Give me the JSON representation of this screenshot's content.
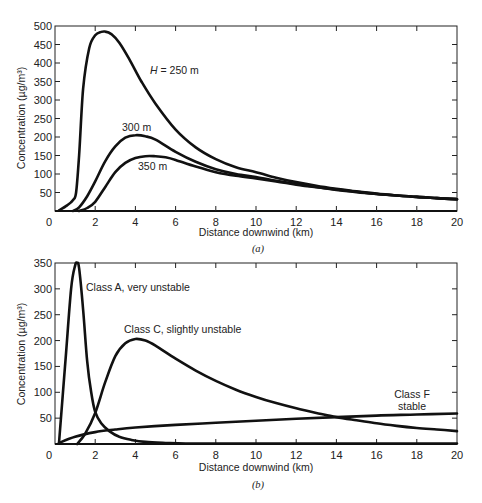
{
  "chart_data": [
    {
      "id": "a",
      "type": "line",
      "caption": "(a)",
      "title": "",
      "xlabel": "Distance downwind (km)",
      "ylabel": "Concentration (µg/m³)",
      "xlim": [
        0,
        20
      ],
      "ylim": [
        0,
        500
      ],
      "xticks": [
        0,
        2,
        4,
        6,
        8,
        10,
        12,
        14,
        16,
        18,
        20
      ],
      "yticks": [
        50,
        100,
        150,
        200,
        250,
        300,
        350,
        400,
        450,
        500
      ],
      "grid": false,
      "legend": "inline annotations",
      "series": [
        {
          "name": "H = 250 m",
          "label_pos": [
            7.4,
            380
          ],
          "x": [
            0.2,
            0.6,
            0.9,
            1.05,
            1.2,
            1.4,
            1.7,
            2.0,
            2.3,
            2.5,
            2.8,
            3.2,
            3.7,
            4.3,
            5.0,
            6.0,
            7.0,
            8.0,
            9.0,
            10.0,
            11.0,
            12.0,
            13.0,
            14.0,
            15.0,
            16.0,
            17.0,
            18.0,
            19.0,
            20.0
          ],
          "y": [
            2,
            15,
            30,
            50,
            150,
            330,
            440,
            475,
            484,
            485,
            478,
            455,
            410,
            350,
            290,
            220,
            172,
            140,
            118,
            105,
            90,
            78,
            68,
            60,
            53,
            47,
            42,
            38,
            35,
            32
          ]
        },
        {
          "name": "300 m",
          "label_pos": [
            3.3,
            215
          ],
          "x": [
            0.9,
            1.2,
            1.6,
            2.0,
            2.5,
            3.0,
            3.5,
            4.0,
            4.5,
            5.0,
            6.0,
            7.0,
            8.0,
            9.0,
            10.0,
            11.0,
            12.0,
            13.0,
            14.0,
            15.0,
            16.0,
            17.0,
            18.0,
            19.0,
            20.0
          ],
          "y": [
            0,
            10,
            40,
            80,
            135,
            175,
            198,
            205,
            202,
            193,
            160,
            133,
            113,
            100,
            92,
            82,
            73,
            65,
            58,
            52,
            46,
            42,
            38,
            35,
            32
          ]
        },
        {
          "name": "350 m",
          "label_pos": [
            4.1,
            118
          ],
          "x": [
            1.2,
            1.6,
            2.0,
            2.5,
            3.0,
            3.5,
            4.0,
            4.5,
            5.0,
            5.5,
            6.0,
            7.0,
            8.0,
            9.0,
            10.0,
            11.0,
            12.0,
            13.0,
            14.0,
            15.0,
            16.0,
            17.0,
            18.0,
            19.0,
            20.0
          ],
          "y": [
            0,
            8,
            25,
            65,
            105,
            130,
            143,
            148,
            148,
            145,
            138,
            120,
            105,
            95,
            88,
            80,
            71,
            64,
            57,
            51,
            46,
            42,
            38,
            35,
            32
          ]
        }
      ]
    },
    {
      "id": "b",
      "type": "line",
      "caption": "(b)",
      "title": "",
      "xlabel": "Distance downwind (km)",
      "ylabel": "Concentration (µg/m³)",
      "xlim": [
        0,
        20
      ],
      "ylim": [
        0,
        350
      ],
      "xticks": [
        0,
        2,
        4,
        6,
        8,
        10,
        12,
        14,
        16,
        18,
        20
      ],
      "yticks": [
        50,
        100,
        150,
        200,
        250,
        300,
        350
      ],
      "grid": false,
      "legend": "inline annotations",
      "series": [
        {
          "name": "Class A, very unstable",
          "label_pos": [
            1.8,
            305
          ],
          "x": [
            0.2,
            0.5,
            0.8,
            1.0,
            1.1,
            1.2,
            1.4,
            1.6,
            1.8,
            2.0,
            2.3,
            2.7,
            3.2,
            3.8,
            4.5,
            5.5,
            6.5,
            8.0,
            10.0,
            14.0,
            20.0
          ],
          "y": [
            2,
            150,
            300,
            345,
            350,
            340,
            260,
            160,
            100,
            62,
            40,
            25,
            14,
            8,
            4,
            2,
            1,
            1,
            1,
            1,
            1
          ]
        },
        {
          "name": "Class C, slightly unstable",
          "label_pos": [
            3.7,
            222
          ],
          "x": [
            1.1,
            1.5,
            2.0,
            2.5,
            3.0,
            3.5,
            4.0,
            4.5,
            5.0,
            6.0,
            7.0,
            8.0,
            9.0,
            10.0,
            11.0,
            12.0,
            13.0,
            14.0,
            15.0,
            16.0,
            17.0,
            18.0,
            19.0,
            20.0
          ],
          "y": [
            0,
            20,
            60,
            120,
            170,
            195,
            203,
            200,
            190,
            165,
            142,
            122,
            105,
            91,
            79,
            69,
            60,
            52,
            46,
            40,
            35,
            31,
            28,
            25
          ]
        },
        {
          "name": "Class F",
          "name_line2": "stable",
          "label_pos": [
            17.6,
            85
          ],
          "x": [
            0.2,
            1.0,
            2.0,
            3.0,
            4.0,
            6.0,
            8.0,
            10.0,
            12.0,
            14.0,
            16.0,
            18.0,
            20.0
          ],
          "y": [
            2,
            14,
            23,
            28,
            32,
            37,
            41,
            45,
            49,
            52,
            55,
            57,
            59
          ]
        }
      ]
    }
  ],
  "panels": {
    "a": {
      "caption": "(a)",
      "xlabel": "Distance downwind (km)",
      "ylabel": "Concentration (µg/m³)",
      "annotations": {
        "h250": "H = 250 m",
        "h300": "300 m",
        "h350": "350 m"
      }
    },
    "b": {
      "caption": "(b)",
      "xlabel": "Distance downwind (km)",
      "ylabel": "Concentration (µg/m³)",
      "annotations": {
        "classA": "Class A, very unstable",
        "classC": "Class C, slightly unstable",
        "classF_line1": "Class F",
        "classF_line2": "stable"
      }
    }
  }
}
